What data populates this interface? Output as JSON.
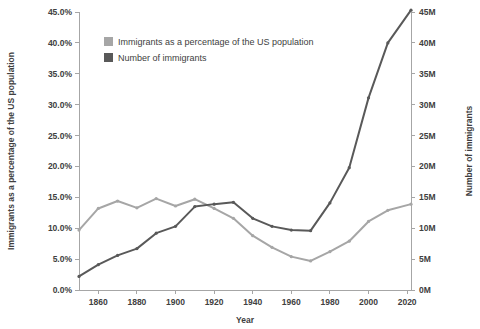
{
  "chart_data": {
    "type": "line",
    "title": "",
    "xlabel": "Year",
    "ylabel": "Immigrants as a percentage of the US population",
    "y2label": "Number of immigrants",
    "grid": false,
    "legend_position": "top-center",
    "xlim": [
      1850,
      2022
    ],
    "xticks": [
      1860,
      1880,
      1900,
      1920,
      1940,
      1960,
      1980,
      2000,
      2020
    ],
    "xtick_labels": [
      "1860",
      "1880",
      "1900",
      "1920",
      "1940",
      "1960",
      "1980",
      "2000",
      "2020"
    ],
    "ylim": [
      0,
      45
    ],
    "yticks": [
      0,
      5,
      10,
      15,
      20,
      25,
      30,
      35,
      40,
      45
    ],
    "ytick_labels": [
      "0.0%",
      "5.0%",
      "10.0%",
      "15.0%",
      "20.0%",
      "25.0%",
      "30.0%",
      "35.0%",
      "40.0%",
      "45.0%"
    ],
    "y2lim": [
      0,
      45
    ],
    "y2ticks": [
      0,
      5,
      10,
      15,
      20,
      25,
      30,
      35,
      40,
      45
    ],
    "y2tick_labels": [
      "0M",
      "5M",
      "10M",
      "15M",
      "20M",
      "25M",
      "30M",
      "35M",
      "40M",
      "45M"
    ],
    "x": [
      1850,
      1860,
      1870,
      1880,
      1890,
      1900,
      1910,
      1920,
      1930,
      1940,
      1950,
      1960,
      1970,
      1980,
      1990,
      2000,
      2010,
      2022
    ],
    "series": [
      {
        "name": "Immigrants as a percentage of the US population",
        "color": "#a6a6a6",
        "axis": "left",
        "unit": "%",
        "values": [
          9.7,
          13.2,
          14.4,
          13.3,
          14.8,
          13.6,
          14.7,
          13.2,
          11.6,
          8.8,
          6.9,
          5.4,
          4.7,
          6.2,
          7.9,
          11.1,
          12.9,
          13.9
        ]
      },
      {
        "name": "Number of immigrants",
        "color": "#595959",
        "axis": "right",
        "unit": "M",
        "values": [
          2.2,
          4.1,
          5.6,
          6.7,
          9.2,
          10.3,
          13.5,
          13.9,
          14.2,
          11.6,
          10.3,
          9.7,
          9.6,
          14.1,
          19.8,
          31.1,
          40.0,
          45.3
        ]
      }
    ],
    "legend": [
      {
        "label": "Immigrants as a percentage of the US population",
        "color": "#a6a6a6"
      },
      {
        "label": "Number of immigrants",
        "color": "#595959"
      }
    ]
  }
}
